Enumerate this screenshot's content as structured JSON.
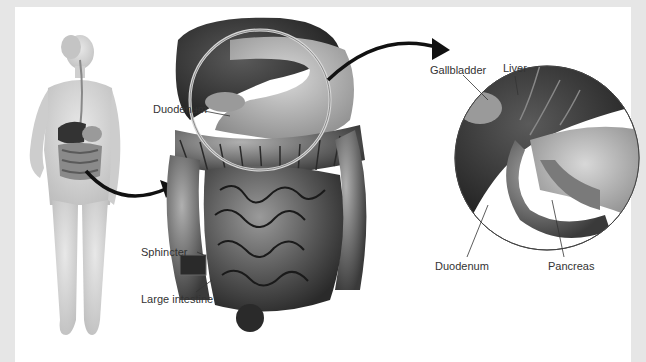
{
  "figure": {
    "background_color": "#e6e6e6",
    "panel_color": "#ffffff",
    "labels": {
      "duodenum_main": "Duodenum",
      "sphincter": "Sphincter",
      "large_intestine": "Large intestine",
      "liver": "Liver",
      "gallbladder": "Gallbladder",
      "duodenum_detail": "Duodenum",
      "pancreas": "Pancreas"
    },
    "panels": [
      {
        "name": "full-body",
        "description": "Female figure showing digestive tract"
      },
      {
        "name": "abdominal-organs",
        "description": "Enlarged view of stomach, liver and intestines"
      },
      {
        "name": "detail-circle",
        "description": "Magnified circle of liver, gallbladder, duodenum and pancreas"
      }
    ]
  }
}
